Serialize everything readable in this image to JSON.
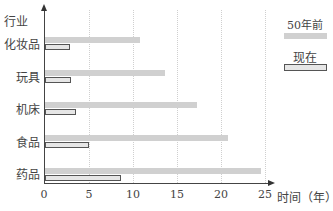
{
  "chart_data": {
    "type": "bar",
    "orientation": "horizontal",
    "title": "",
    "ylabel": "行业",
    "xlabel": "时间（年）",
    "categories": [
      "化妆品",
      "玩具",
      "机床",
      "食品",
      "药品"
    ],
    "series": [
      {
        "name": "50年前",
        "values": [
          10.8,
          13.6,
          17.2,
          20.7,
          24.4
        ],
        "color": "#d0d0d0"
      },
      {
        "name": "现在",
        "values": [
          2.8,
          2.9,
          3.5,
          5.0,
          8.6
        ],
        "color": "#e6e6e6",
        "border": "#555555"
      }
    ],
    "xticks": [
      "0",
      "5",
      "10",
      "15",
      "20",
      "25"
    ],
    "xlim": [
      0,
      25
    ],
    "grid": "vertical dotted",
    "legend_position": "top-right"
  }
}
